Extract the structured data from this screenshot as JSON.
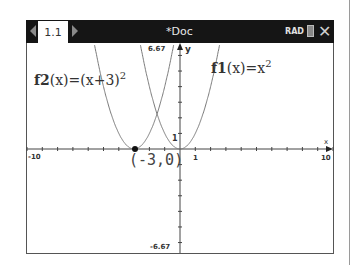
{
  "titlebar": {
    "tab_label": "1.1",
    "doc_title": "*Doc",
    "angle_mode": "RAD",
    "icons": {
      "prev": "left-arrow-icon",
      "next": "right-arrow-icon",
      "battery": "battery-icon",
      "close": "close-icon"
    }
  },
  "graph": {
    "window": {
      "xmin": -10,
      "xmax": 10,
      "ymin": -6.67,
      "ymax": 6.67
    },
    "axis_labels": {
      "x": "x",
      "y": "y"
    },
    "tick_labels": {
      "xmin": "-10",
      "xmax": "10",
      "x_one": "1",
      "ymax": "6.67",
      "ymin": "-6.67",
      "y_one": "1"
    },
    "functions": [
      {
        "name": "f1",
        "arg": "x",
        "expr": "x",
        "exp": "2",
        "label_prefix": "f1",
        "label_lhs_paren": "(x)",
        "label_eq": "=x"
      },
      {
        "name": "f2",
        "arg": "x",
        "expr": "(x+3)",
        "exp": "2",
        "label_prefix": "f2",
        "label_lhs_paren": "(x)",
        "label_eq": "=(x+3)"
      }
    ],
    "point": {
      "x": -3,
      "y": 0,
      "label": "(-3,0)"
    },
    "curve_color": "#7a7a7a"
  }
}
